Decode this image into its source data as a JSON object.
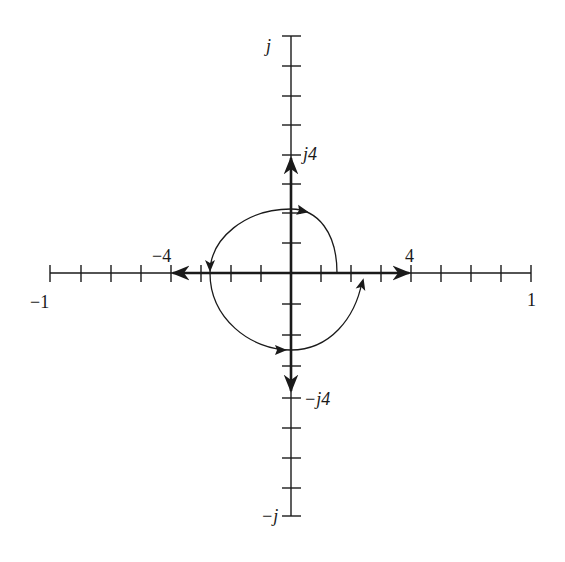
{
  "diagram": {
    "type": "complex-plane-spiral",
    "colors": {
      "ink": "#1a1a1a",
      "background": "#ffffff"
    },
    "axes": {
      "real": {
        "label_left": "−1",
        "label_right": "1",
        "tick_count_each_side": 8,
        "marked_ticks": {
          "neg": "−4",
          "pos": "4"
        }
      },
      "imag": {
        "label_top": "j",
        "label_bottom": "−j",
        "tick_count_each_side": 8,
        "marked_ticks": {
          "pos": "j4",
          "neg": "−j4"
        }
      }
    },
    "vectors": [
      {
        "name": "real-positive-vector",
        "from": [
          0,
          0
        ],
        "to": [
          4,
          0
        ]
      },
      {
        "name": "real-negative-vector",
        "from": [
          0,
          0
        ],
        "to": [
          -4,
          0
        ]
      },
      {
        "name": "imag-positive-vector",
        "from": [
          0,
          0
        ],
        "to": [
          0,
          4
        ]
      },
      {
        "name": "imag-negative-vector",
        "from": [
          0,
          0
        ],
        "to": [
          0,
          -4
        ]
      }
    ],
    "spiral": {
      "direction": "counterclockwise",
      "start": [
        1.53,
        0
      ],
      "points": [
        [
          1.53,
          0
        ],
        [
          0,
          2.13
        ],
        [
          -2.7,
          0
        ],
        [
          0,
          -2.57
        ],
        [
          2.37,
          -0.2
        ]
      ],
      "arrows_at": [
        "top",
        "left",
        "bottom",
        "end"
      ]
    }
  }
}
